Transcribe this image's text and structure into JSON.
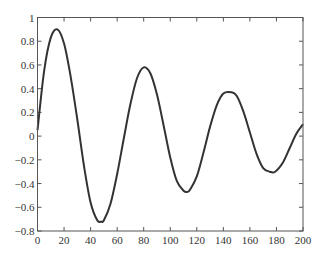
{
  "chart_data": {
    "type": "line",
    "title": "",
    "xlabel": "",
    "ylabel": "",
    "xlim": [
      0,
      200
    ],
    "ylim": [
      -0.8,
      1
    ],
    "grid": false,
    "legend": null,
    "x_ticks": [
      0,
      20,
      40,
      60,
      80,
      100,
      120,
      140,
      160,
      180,
      200
    ],
    "x_tick_labels": [
      "0",
      "20",
      "40",
      "60",
      "80",
      "100",
      "120",
      "140",
      "160",
      "180",
      "200"
    ],
    "y_ticks": [
      -0.8,
      -0.6,
      -0.4,
      -0.2,
      0,
      0.2,
      0.4,
      0.6,
      0.8,
      1
    ],
    "y_tick_labels": [
      "−0.8",
      "−0.6",
      "−0.4",
      "−0.2",
      "0",
      "0.2",
      "0.4",
      "0.6",
      "0.8",
      "1"
    ],
    "series": [
      {
        "name": "damped oscillation",
        "color": "#333333",
        "x": [
          0,
          5,
          10,
          15,
          20,
          25,
          30,
          35,
          40,
          45,
          48,
          50,
          55,
          60,
          65,
          70,
          75,
          80,
          85,
          90,
          95,
          100,
          105,
          110,
          113,
          115,
          120,
          125,
          130,
          135,
          140,
          146,
          150,
          155,
          160,
          165,
          170,
          175,
          179,
          185,
          190,
          195,
          200
        ],
        "y": [
          0.05,
          0.55,
          0.83,
          0.9,
          0.78,
          0.5,
          0.14,
          -0.25,
          -0.56,
          -0.71,
          -0.72,
          -0.71,
          -0.57,
          -0.32,
          -0.02,
          0.27,
          0.49,
          0.58,
          0.53,
          0.35,
          0.09,
          -0.18,
          -0.38,
          -0.46,
          -0.47,
          -0.45,
          -0.34,
          -0.14,
          0.08,
          0.26,
          0.36,
          0.37,
          0.34,
          0.21,
          0.03,
          -0.15,
          -0.27,
          -0.3,
          -0.3,
          -0.22,
          -0.1,
          0.02,
          0.1
        ]
      }
    ]
  }
}
